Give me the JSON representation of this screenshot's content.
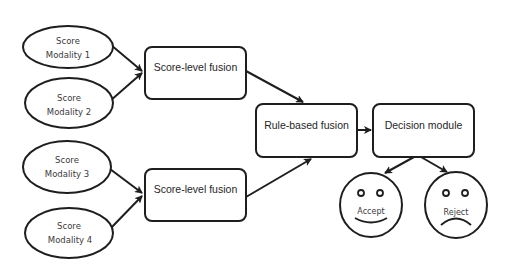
{
  "diagram": {
    "inputs": [
      {
        "line1": "Score",
        "line2": "Modality 1"
      },
      {
        "line1": "Score",
        "line2": "Modality 2"
      },
      {
        "line1": "Score",
        "line2": "Modality 3"
      },
      {
        "line1": "Score",
        "line2": "Modality 4"
      }
    ],
    "score_fusion": [
      {
        "label": "Score-level fusion"
      },
      {
        "label": "Score-level fusion"
      }
    ],
    "rule_fusion": {
      "label": "Rule-based fusion"
    },
    "decision": {
      "label": "Decision module"
    },
    "outcomes": [
      {
        "label": "Accept",
        "face": "happy-face-icon"
      },
      {
        "label": "Reject",
        "face": "sad-face-icon"
      }
    ],
    "colors": {
      "stroke": "#1e1e1e",
      "text": "#262626",
      "background": "#ffffff"
    }
  }
}
